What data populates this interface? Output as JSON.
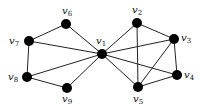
{
  "graph": {
    "nodes": [
      {
        "id": "v1",
        "label": "v",
        "sub": "1",
        "x": 102,
        "y": 54,
        "lx": 96,
        "ly": 36
      },
      {
        "id": "v2",
        "label": "v",
        "sub": "2",
        "x": 137,
        "y": 23,
        "lx": 132,
        "ly": 5
      },
      {
        "id": "v3",
        "label": "v",
        "sub": "3",
        "x": 174,
        "y": 39,
        "lx": 181,
        "ly": 33
      },
      {
        "id": "v4",
        "label": "v",
        "sub": "4",
        "x": 177,
        "y": 75,
        "lx": 184,
        "ly": 70
      },
      {
        "id": "v5",
        "label": "v",
        "sub": "5",
        "x": 138,
        "y": 87,
        "lx": 133,
        "ly": 94
      },
      {
        "id": "v6",
        "label": "v",
        "sub": "6",
        "x": 66,
        "y": 24,
        "lx": 62,
        "ly": 6
      },
      {
        "id": "v7",
        "label": "v",
        "sub": "7",
        "x": 29,
        "y": 41,
        "lx": 9,
        "ly": 36
      },
      {
        "id": "v8",
        "label": "v",
        "sub": "8",
        "x": 27,
        "y": 77,
        "lx": 8,
        "ly": 72
      },
      {
        "id": "v9",
        "label": "v",
        "sub": "9",
        "x": 67,
        "y": 88,
        "lx": 62,
        "ly": 94
      }
    ],
    "edges": [
      [
        "v1",
        "v6"
      ],
      [
        "v1",
        "v7"
      ],
      [
        "v1",
        "v8"
      ],
      [
        "v1",
        "v9"
      ],
      [
        "v6",
        "v7"
      ],
      [
        "v7",
        "v8"
      ],
      [
        "v8",
        "v9"
      ],
      [
        "v1",
        "v2"
      ],
      [
        "v1",
        "v3"
      ],
      [
        "v1",
        "v4"
      ],
      [
        "v1",
        "v5"
      ],
      [
        "v2",
        "v3"
      ],
      [
        "v2",
        "v5"
      ],
      [
        "v3",
        "v4"
      ],
      [
        "v3",
        "v5"
      ],
      [
        "v4",
        "v5"
      ]
    ],
    "colors": {
      "node": "#000000",
      "edge": "#222222"
    }
  }
}
